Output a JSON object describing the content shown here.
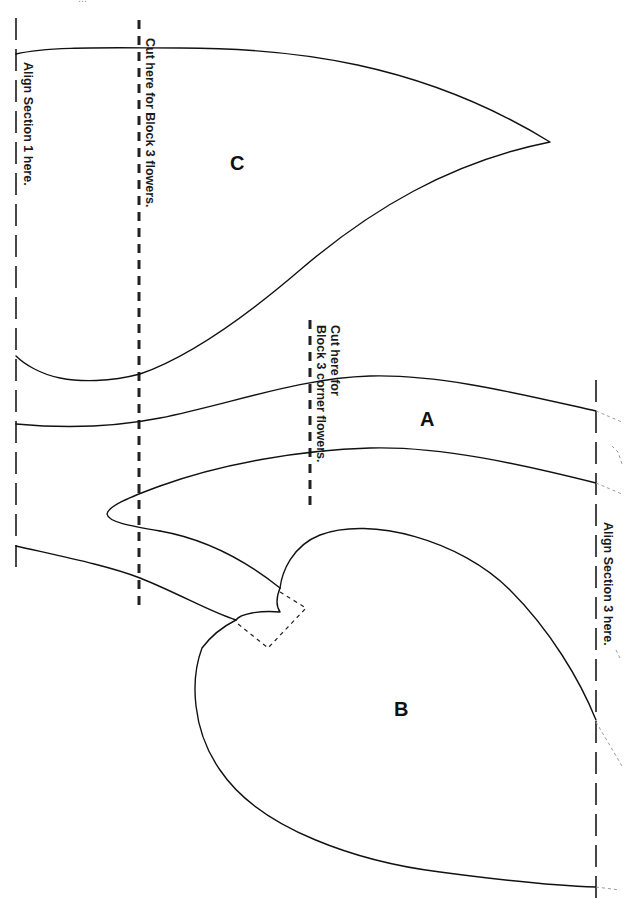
{
  "page": {
    "header_text": "...",
    "background": "#ffffff",
    "line_color": "#111111"
  },
  "labels": {
    "align_section_1": "Align Section 1 here.",
    "align_section_3": "Align Section 3 here.",
    "cut_block3_flowers": "Cut here for Block 3 flowers.",
    "cut_block3_corner_line1": "Cut here for",
    "cut_block3_corner_line2": "Block 3 corner flowers."
  },
  "pieces": {
    "a": "A",
    "b": "B",
    "c": "C"
  }
}
